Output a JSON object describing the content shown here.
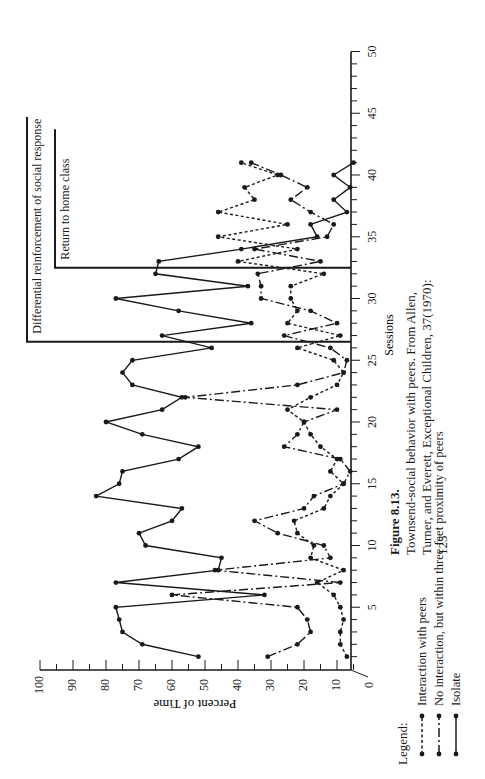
{
  "figure": {
    "number_label": "Figure 8.13.",
    "caption_line1": "Townsend-social behavior with peers. From Allen,",
    "caption_line2": "Turner, and Everett, Exceptional Children, 37(1970):",
    "caption_line3": "123"
  },
  "legend": {
    "title": "Legend:",
    "items": [
      {
        "label": "Interaction with peers",
        "style": "dotted"
      },
      {
        "label": "No interaction, but within three feet proximity of peers",
        "style": "dashdot"
      },
      {
        "label": "Isolate",
        "style": "solid"
      }
    ]
  },
  "phases": [
    {
      "label": "Differential reinforcement of social response",
      "start_session": 26.5
    },
    {
      "label": "Return to home class",
      "start_session": 32.5
    }
  ],
  "chart_data": {
    "type": "line",
    "title": "Townsend-social behavior with peers",
    "xlabel": "Sessions",
    "ylabel": "Percent of Time",
    "xlim": [
      0,
      50
    ],
    "ylim": [
      0,
      100
    ],
    "xticks": [
      5,
      10,
      15,
      20,
      25,
      30,
      35,
      40,
      45,
      50
    ],
    "yticks": [
      0,
      10,
      20,
      30,
      40,
      50,
      60,
      70,
      80,
      90,
      100
    ],
    "orientation": "rotated 90° counter-clockwise (sessions run bottom-to-top, percent runs right-to-left)",
    "grid": false,
    "legend_position": "bottom",
    "x": [
      1,
      2,
      3,
      4,
      5,
      6,
      7,
      8,
      9,
      10,
      11,
      12,
      13,
      14,
      15,
      16,
      17,
      18,
      19,
      20,
      21,
      22,
      23,
      24,
      25,
      26,
      27,
      28,
      29,
      30,
      31,
      32,
      33,
      34,
      35,
      36,
      37,
      38,
      39,
      40,
      41
    ],
    "series": [
      {
        "name": "Isolate",
        "style": "solid",
        "values": [
          52,
          69,
          75,
          76,
          77,
          32,
          77,
          46,
          45,
          68,
          70,
          60,
          57,
          83,
          76,
          75,
          58,
          52,
          69,
          80,
          63,
          57,
          72,
          75,
          72,
          48,
          63,
          36,
          58,
          77,
          37,
          65,
          64,
          39,
          16,
          18,
          7,
          11,
          6,
          11,
          5
        ]
      },
      {
        "name": "No interaction, but within three feet proximity of peers",
        "style": "dashdot",
        "values": [
          31,
          22,
          18,
          19,
          22,
          60,
          9,
          47,
          12,
          14,
          28,
          35,
          20,
          17,
          8,
          6,
          9,
          26,
          22,
          20,
          10,
          56,
          22,
          8,
          7,
          12,
          26,
          10,
          18,
          33,
          33,
          34,
          15,
          35,
          13,
          11,
          18,
          24,
          19,
          27,
          36
        ]
      },
      {
        "name": "Interaction with peers",
        "style": "dotted",
        "values": [
          7,
          9,
          9,
          8,
          9,
          11,
          16,
          8,
          18,
          17,
          22,
          23,
          14,
          12,
          8,
          12,
          10,
          15,
          18,
          20,
          25,
          18,
          10,
          8,
          11,
          22,
          9,
          25,
          22,
          24,
          24,
          14,
          40,
          22,
          46,
          25,
          46,
          35,
          38,
          28,
          39
        ]
      }
    ]
  }
}
